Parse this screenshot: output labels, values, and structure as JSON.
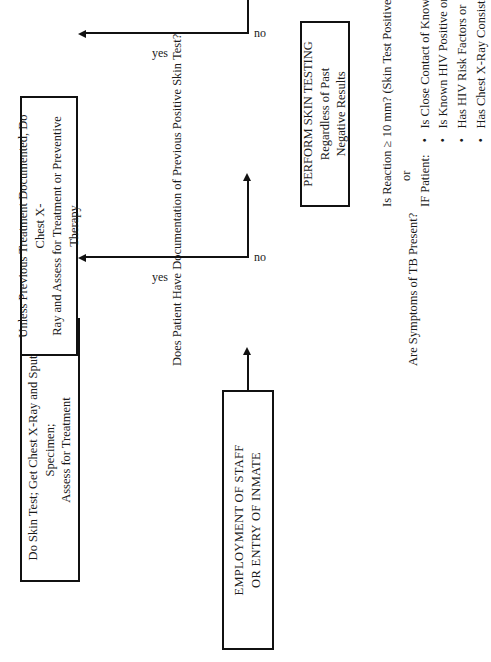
{
  "document": {
    "orientation": "rotated-90-ccw",
    "ink_color": "#111111",
    "page_color": "#ffffff"
  },
  "nodes": {
    "entry": "EMPLOYMENT OF STAFF\nOR ENTRY OF INMATE",
    "entry_line1": "EMPLOYMENT OF STAFF",
    "entry_line2": "OR ENTRY OF INMATE",
    "symptom_action_line1": "Do Skin Test; Get Chest X-Ray and Sputum Specimen;",
    "symptom_action_line2": "Assess for Treatment",
    "prev_positive_action_line1": "Unless Previous Treatment Documented, Do Chest X-",
    "prev_positive_action_line2": "Ray and Assess for Treatment or Preventive Therapy",
    "skin_testing_line1": "PERFORM SKIN TESTING",
    "skin_testing_line2": "Regardless of Past",
    "skin_testing_line3": "Negative Results"
  },
  "decisions": {
    "symptoms_question": "Are Symptoms of TB Present?",
    "prev_positive_question": "Does Patient Have Documentation of Previous Positive Skin Test?"
  },
  "branch_labels": {
    "symptoms_yes": "yes",
    "symptoms_no": "no",
    "prev_positive_yes": "yes",
    "prev_positive_no": "no"
  },
  "legend": {
    "reaction_line": "Is Reaction ≥ 10 mm? (Skin Test Positive)",
    "or_label": "or",
    "if_patient_label": "IF Patient:",
    "criteria": [
      "Is Close Contact of Known Case or",
      "Is Known HIV Positive or",
      "Has HIV Risk Factors or",
      "Has Chest X-Ray Consistent with Past TB"
    ]
  }
}
